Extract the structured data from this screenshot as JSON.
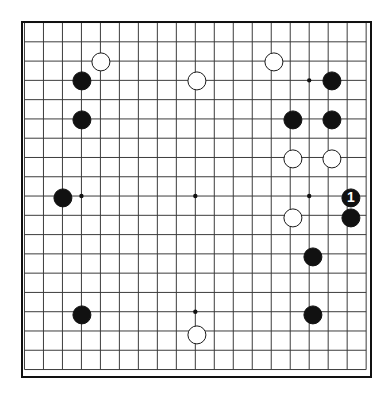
{
  "board": {
    "type": "go-board",
    "size": 19,
    "background_color": "#ffffff",
    "line_color": "#3a3a3a",
    "border_color": "#111111",
    "black_color": "#111111",
    "white_color": "#ffffff",
    "left": 21,
    "top": 21,
    "width": 351,
    "height": 357,
    "cell_w": 19.2,
    "cell_h": 19.5,
    "origin_x": 25,
    "origin_y": 23,
    "stone_radius": 9.6,
    "border_width": 2.5,
    "line_width": 1,
    "star_radius": 2.2,
    "star_points": [
      {
        "col": 3,
        "row": 3
      },
      {
        "col": 9,
        "row": 3
      },
      {
        "col": 15,
        "row": 3
      },
      {
        "col": 3,
        "row": 9
      },
      {
        "col": 9,
        "row": 9
      },
      {
        "col": 15,
        "row": 9
      },
      {
        "col": 3,
        "row": 15
      },
      {
        "col": 9,
        "row": 15
      },
      {
        "col": 15,
        "row": 15
      }
    ],
    "stones": [
      {
        "name": "white-stone-d17",
        "color": "white",
        "col": 4,
        "row": 2,
        "label": ""
      },
      {
        "name": "white-stone-k16",
        "color": "white",
        "col": 9,
        "row": 3,
        "label": ""
      },
      {
        "name": "white-stone-n18",
        "color": "white",
        "col": 13,
        "row": 2,
        "label": ""
      },
      {
        "name": "black-stone-c16",
        "color": "black",
        "col": 3,
        "row": 3,
        "label": ""
      },
      {
        "name": "black-stone-q16",
        "color": "black",
        "col": 16,
        "row": 3,
        "label": ""
      },
      {
        "name": "black-stone-c14",
        "color": "black",
        "col": 3,
        "row": 5,
        "label": ""
      },
      {
        "name": "black-stone-n14",
        "color": "black",
        "col": 14,
        "row": 5,
        "label": ""
      },
      {
        "name": "black-stone-q14",
        "color": "black",
        "col": 16,
        "row": 5,
        "label": ""
      },
      {
        "name": "white-stone-o12",
        "color": "white",
        "col": 14,
        "row": 7,
        "label": ""
      },
      {
        "name": "white-stone-r12",
        "color": "white",
        "col": 16,
        "row": 7,
        "label": ""
      },
      {
        "name": "black-stone-c10",
        "color": "black",
        "col": 2,
        "row": 9,
        "label": ""
      },
      {
        "name": "black-stone-move-1",
        "color": "black",
        "col": 17,
        "row": 9,
        "label": "1"
      },
      {
        "name": "white-stone-o9",
        "color": "white",
        "col": 14,
        "row": 10,
        "label": ""
      },
      {
        "name": "black-stone-s9",
        "color": "black",
        "col": 17,
        "row": 10,
        "label": ""
      },
      {
        "name": "black-stone-q7",
        "color": "black",
        "col": 15,
        "row": 12,
        "label": ""
      },
      {
        "name": "black-stone-d4",
        "color": "black",
        "col": 3,
        "row": 15,
        "label": ""
      },
      {
        "name": "black-stone-q4",
        "color": "black",
        "col": 15,
        "row": 15,
        "label": ""
      },
      {
        "name": "white-stone-k3",
        "color": "white",
        "col": 9,
        "row": 16,
        "label": ""
      }
    ]
  }
}
